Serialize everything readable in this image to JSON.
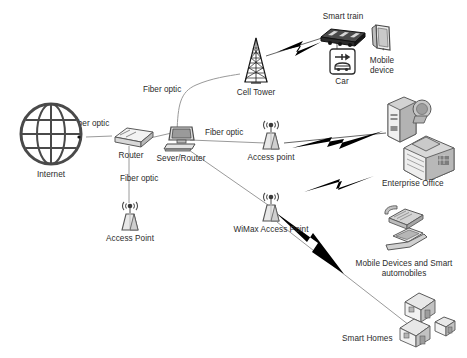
{
  "diagram": {
    "background_color": "#ffffff",
    "text_color": "#2b2b2b",
    "wired_link_color": "#9a9a9a",
    "wireless_link_color": "#000000",
    "width": 467,
    "height": 358
  },
  "nodes": [
    {
      "id": "internet",
      "label": "Internet",
      "icon": "globe-icon",
      "x": 14,
      "y": 101,
      "w": 74,
      "h": 76
    },
    {
      "id": "router",
      "label": "Router",
      "icon": "router-box-icon",
      "x": 103,
      "y": 124,
      "w": 56,
      "h": 34
    },
    {
      "id": "server-router",
      "label": "Sever/Router",
      "icon": "desktop-computer-icon",
      "x": 152,
      "y": 125,
      "w": 58,
      "h": 36
    },
    {
      "id": "cell-tower",
      "label": "Cell Tower",
      "icon": "cell-tower-icon",
      "x": 229,
      "y": 36,
      "w": 54,
      "h": 50
    },
    {
      "id": "smart-train",
      "label": "Smart train",
      "icon": "train-icon",
      "x": 313,
      "y": 12,
      "w": 60,
      "h": 42
    },
    {
      "id": "car",
      "label": "Car",
      "icon": "car-icon",
      "x": 324,
      "y": 48,
      "w": 36,
      "h": 36
    },
    {
      "id": "mobile-device",
      "label": "Mobile\ndevice",
      "icon": "tablet-icon",
      "x": 358,
      "y": 22,
      "w": 48,
      "h": 46
    },
    {
      "id": "access-point-1",
      "label": "Access point",
      "icon": "access-point-icon",
      "x": 249,
      "y": 116,
      "w": 44,
      "h": 40
    },
    {
      "id": "access-point-2",
      "label": "Access Point",
      "icon": "access-point-icon",
      "x": 108,
      "y": 197,
      "w": 44,
      "h": 40
    },
    {
      "id": "wimax-ap",
      "label": "WiMax Access Point",
      "icon": "access-point-icon",
      "x": 249,
      "y": 188,
      "w": 44,
      "h": 40
    },
    {
      "id": "enterprise",
      "label": "Enterprise Office",
      "icon": "server-building-icon",
      "x": 382,
      "y": 92,
      "w": 78,
      "h": 88
    },
    {
      "id": "mobile-devices",
      "label": "Mobile Devices and Smart automobiles",
      "icon": "phone-laptop-icon",
      "x": 390,
      "y": 204,
      "w": 62,
      "h": 58
    },
    {
      "id": "smart-homes",
      "label": "Smart Homes",
      "icon": "houses-icon",
      "x": 398,
      "y": 288,
      "w": 66,
      "h": 56
    }
  ],
  "wire_labels": [
    {
      "id": "fo-internet-router",
      "text": "Fiber optic",
      "x": 71,
      "y": 119
    },
    {
      "id": "fo-router-tower",
      "text": "Fiber optic",
      "x": 143,
      "y": 85
    },
    {
      "id": "fo-server-ap",
      "text": "Fiber optic",
      "x": 205,
      "y": 128
    },
    {
      "id": "fo-router-ap2",
      "text": "Fiber optic",
      "x": 120,
      "y": 174
    }
  ],
  "links": [
    {
      "id": "internet-to-router",
      "type": "fiber",
      "label": "Fiber optic"
    },
    {
      "id": "router-to-server",
      "type": "fiber",
      "label": ""
    },
    {
      "id": "router-to-cell-tower",
      "type": "fiber",
      "label": "Fiber optic"
    },
    {
      "id": "router-to-access-point-2",
      "type": "fiber",
      "label": "Fiber optic"
    },
    {
      "id": "server-to-access-point-1",
      "type": "fiber",
      "label": "Fiber optic"
    },
    {
      "id": "server-to-wimax",
      "type": "fiber",
      "label": ""
    },
    {
      "id": "cell-tower-to-train",
      "type": "wireless",
      "label": ""
    },
    {
      "id": "access-point-1-to-enterprise",
      "type": "wireless",
      "label": ""
    },
    {
      "id": "enterprise-office-link",
      "type": "wireless",
      "label": ""
    },
    {
      "id": "wimax-to-mobile-homes",
      "type": "wireless",
      "label": ""
    },
    {
      "id": "wimax-to-smart-homes",
      "type": "fiber",
      "label": ""
    }
  ]
}
